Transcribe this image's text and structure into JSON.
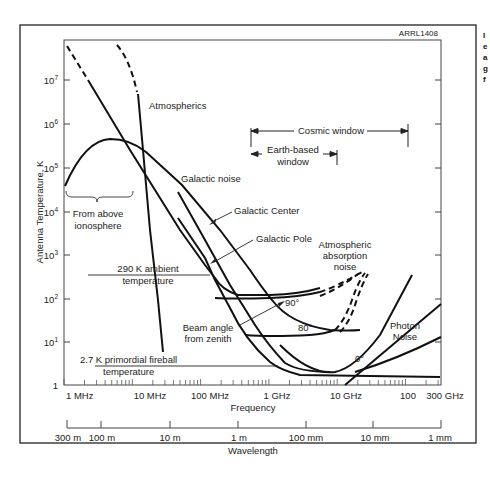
{
  "figure_id": "ARRL1408",
  "side_text_fragment": [
    "I",
    "e",
    "a",
    "g",
    "f"
  ],
  "chart_data": {
    "type": "line",
    "title": "",
    "xlabel": "Frequency",
    "ylabel": "Antenna Temperature, K",
    "x_scale": "log",
    "y_scale": "log",
    "xlim_hz": [
      1000000.0,
      300000000000.0
    ],
    "ylim_k": [
      1,
      100000000.0
    ],
    "x_ticks": [
      "1 MHz",
      "10 MHz",
      "100 MHz",
      "1 GHz",
      "10 GHz",
      "100",
      "300 GHz"
    ],
    "y_ticks": [
      "1",
      "10^1",
      "10^2",
      "10^3",
      "10^4",
      "10^5",
      "10^6",
      "10^7"
    ],
    "secondary_xlabel": "Wavelength",
    "secondary_x_ticks": [
      "300 m",
      "100 m",
      "10 m",
      "1 m",
      "100 mm",
      "10 mm",
      "1 mm"
    ],
    "grid": false,
    "series": [
      {
        "name": "Galactic noise (dashed above ~10^7)",
        "points_hz_k": [
          [
            1000000.0,
            60000000.0
          ],
          [
            2000000.0,
            15000000.0
          ],
          [
            5000000.0,
            2000000.0
          ],
          [
            10000000.0,
            300000.0
          ],
          [
            30000000.0,
            20000.0
          ],
          [
            100000000.0,
            1500.0
          ],
          [
            200000000.0,
            500.0
          ],
          [
            300000000.0,
            200.0
          ],
          [
            600000000.0,
            120.0
          ],
          [
            1000000000.0,
            100.0
          ],
          [
            3000000000.0,
            100.0
          ],
          [
            10000000000.0,
            150.0
          ],
          [
            20000000000.0,
            250.0
          ]
        ]
      },
      {
        "name": "Atmospherics (dashed above ~10^7)",
        "points_hz_k": [
          [
            3000000.0,
            60000000.0
          ],
          [
            6000000.0,
            20000000.0
          ],
          [
            8000000.0,
            5000000.0
          ],
          [
            10000000.0,
            600000.0
          ],
          [
            12000000.0,
            100000.0
          ],
          [
            15000000.0,
            5000.0
          ],
          [
            20000000.0,
            100.0
          ],
          [
            25000000.0,
            6
          ]
        ]
      },
      {
        "name": "From above ionosphere",
        "points_hz_k": [
          [
            1000000.0,
            35000.0
          ],
          [
            2000000.0,
            200000.0
          ],
          [
            4000000.0,
            450000.0
          ],
          [
            8000000.0,
            350000.0
          ],
          [
            15000000.0,
            150000.0
          ],
          [
            30000000.0,
            50000.0
          ],
          [
            100000000.0,
            10000.0
          ],
          [
            300000000.0,
            1500.0
          ],
          [
            500000000.0,
            300.0
          ],
          [
            1000000000.0,
            140.0
          ]
        ]
      },
      {
        "name": "Galactic Center",
        "points_hz_k": [
          [
            30000000.0,
            100000.0
          ],
          [
            100000000.0,
            10000.0
          ],
          [
            300000000.0,
            1000.0
          ],
          [
            1000000000.0,
            80.0
          ],
          [
            3000000000.0,
            10.0
          ],
          [
            6000000000.0,
            4
          ],
          [
            10000000000.0,
            3
          ],
          [
            30000000000.0,
            3
          ],
          [
            100000000000.0,
            3
          ]
        ]
      },
      {
        "name": "Galactic Pole",
        "points_hz_k": [
          [
            30000000.0,
            15000.0
          ],
          [
            100000000.0,
            2000.0
          ],
          [
            300000000.0,
            200.0
          ],
          [
            500000000.0,
            30.0
          ],
          [
            1000000000.0,
            8
          ],
          [
            3000000000.0,
            3.5
          ],
          [
            10000000000.0,
            3.2
          ],
          [
            100000000000.0,
            3.1
          ],
          [
            300000000000.0,
            3.2
          ]
        ]
      },
      {
        "name": "Beam angle 90°",
        "points_hz_k": [
          [
            500000000.0,
            100.0
          ],
          [
            1000000000.0,
            95.0
          ],
          [
            3000000000.0,
            100.0
          ],
          [
            10000000000.0,
            120.0
          ],
          [
            20000000000.0,
            180.0
          ],
          [
            30000000000.0,
            280.0
          ]
        ]
      },
      {
        "name": "Beam angle 80°",
        "points_hz_k": [
          [
            500000000.0,
            16.0
          ],
          [
            1000000000.0,
            14.0
          ],
          [
            5000000000.0,
            14.0
          ],
          [
            10000000000.0,
            15.0
          ],
          [
            20000000000.0,
            20.0
          ],
          [
            30000000000.0,
            80.0
          ],
          [
            40000000000.0,
            250.0
          ]
        ]
      },
      {
        "name": "Beam angle 0°",
        "points_hz_k": [
          [
            1000000000.0,
            5
          ],
          [
            3000000000.0,
            3.2
          ],
          [
            10000000000.0,
            3.1
          ],
          [
            30000000000.0,
            3.5
          ],
          [
            100000000000.0,
            6
          ],
          [
            300000000000.0,
            15.0
          ]
        ]
      },
      {
        "name": "Atmospheric absorption noise (rising)",
        "points_hz_k": [
          [
            10000000000.0,
            3
          ],
          [
            20000000000.0,
            5
          ],
          [
            50000000000.0,
            30.0
          ],
          [
            100000000000.0,
            100.0
          ],
          [
            150000000000.0,
            300.0
          ]
        ]
      },
      {
        "name": "Photon Noise",
        "points_hz_k": [
          [
            25000000000.0,
            1
          ],
          [
            100000000000.0,
            4
          ],
          [
            300000000000.0,
            16.0
          ]
        ]
      }
    ],
    "constant_lines": [
      {
        "name": "290 K ambient temperature",
        "value_k": 290
      },
      {
        "name": "2.7 K primordial fireball temperature",
        "value_k": 2.7
      }
    ],
    "windows": [
      {
        "name": "Cosmic window",
        "from_hz": 300000000.0,
        "to_hz": 60000000000.0
      },
      {
        "name": "Earth-based window",
        "from_hz": 300000000.0,
        "to_hz": 20000000000.0
      }
    ],
    "annotations": [
      "Atmospherics",
      "Galactic noise",
      "Galactic Center",
      "Galactic Pole",
      "From above ionosphere",
      "290 K ambient temperature",
      "2.7 K primordial fireball temperature",
      "Cosmic window",
      "Earth-based window",
      "Atmospheric absorption noise",
      "Beam angle from zenith",
      "90°",
      "80°",
      "0°",
      "Photon Noise"
    ]
  },
  "labels": {
    "figure_id": "ARRL1408",
    "atmospherics": "Atmospherics",
    "galactic_noise": "Galactic noise",
    "galactic_center": "Galactic Center",
    "galactic_pole": "Galactic Pole",
    "from_above_1": "From above",
    "from_above_2": "ionosphere",
    "ambient_1": "290 K ambient",
    "ambient_2": "temperature",
    "fireball_1": "2.7 K primordial fireball",
    "fireball_2": "temperature",
    "cosmic_window": "Cosmic window",
    "earth_window_1": "Earth-based",
    "earth_window_2": "window",
    "absorption_1": "Atmospheric",
    "absorption_2": "absorption",
    "absorption_3": "noise",
    "beam_1": "Beam angle",
    "beam_2": "from zenith",
    "angle_90": "90°",
    "angle_80": "80°",
    "angle_0": "0°",
    "photon_1": "Photon",
    "photon_2": "Noise",
    "ylabel": "Antenna Temperature, K",
    "xlabel": "Frequency",
    "x2label": "Wavelength",
    "xt_1mhz": "1 MHz",
    "xt_10mhz": "10 MHz",
    "xt_100mhz": "100 MHz",
    "xt_1ghz": "1 GHz",
    "xt_10ghz": "10 GHz",
    "xt_100": "100",
    "xt_300ghz": "300 GHz",
    "wt_300m": "300 m",
    "wt_100m": "100 m",
    "wt_10m": "10 m",
    "wt_1m": "1 m",
    "wt_100mm": "100 mm",
    "wt_10mm": "10 mm",
    "wt_1mm": "1 mm",
    "yt_1": "1",
    "yt_base": "10",
    "yt_e1": "1",
    "yt_e2": "2",
    "yt_e3": "3",
    "yt_e4": "4",
    "yt_e5": "5",
    "yt_e6": "6",
    "yt_e7": "7"
  }
}
